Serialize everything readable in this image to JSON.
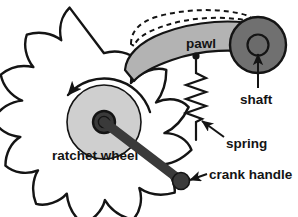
{
  "diagram": {
    "labels": {
      "pawl": "pawl",
      "shaft": "shaft",
      "spring": "spring",
      "ratchet_wheel": "ratchet wheel",
      "crank_handle": "crank handle"
    },
    "colors": {
      "background": "#ffffff",
      "outline": "#141414",
      "pawl_fill": "#b3b3b3",
      "shaft_fill": "#707070",
      "shaft_inner_fill": "#6b6b6b",
      "hub_fill": "#cfcfcf",
      "hub_boss_fill": "#3a3a3a",
      "crank_fill": "#3a3a3a",
      "tooth_fill": "#ffffff",
      "text": "#141414"
    },
    "parts": [
      {
        "name": "ratchet-wheel",
        "label": "ratchet wheel",
        "teeth_count": 12,
        "center": [
          104,
          122
        ],
        "outer_radius": 74,
        "hub_radius": 38,
        "boss_radius": 11
      },
      {
        "name": "pawl",
        "label": "pawl",
        "fill": "#b3b3b3",
        "pivot": "shaft",
        "has_dashed_raised_position": true
      },
      {
        "name": "shaft",
        "label": "shaft",
        "center": [
          258,
          45
        ],
        "outer_radius": 28,
        "inner_radius": 11
      },
      {
        "name": "spring",
        "label": "spring",
        "coils": 7,
        "top_anchor": [
          196,
          56
        ],
        "bottom": [
          196,
          126
        ]
      },
      {
        "name": "crank-handle",
        "label": "crank handle",
        "from": [
          104,
          122
        ],
        "to": [
          180,
          180
        ],
        "knob_radius": 9
      }
    ],
    "annotations": [
      {
        "name": "rotation-arrow",
        "kind": "curved-arrow",
        "direction": "counterclockwise"
      },
      {
        "name": "shaft-leader",
        "kind": "straight-arrow",
        "points_to": "shaft"
      },
      {
        "name": "spring-leader",
        "kind": "straight-arrow",
        "points_to": "spring"
      },
      {
        "name": "crank-handle-leader",
        "kind": "straight-arrow",
        "points_to": "crank-handle"
      },
      {
        "name": "pawl-dashed-outline",
        "kind": "dashed-outline",
        "describes": "pawl raised position"
      }
    ]
  }
}
